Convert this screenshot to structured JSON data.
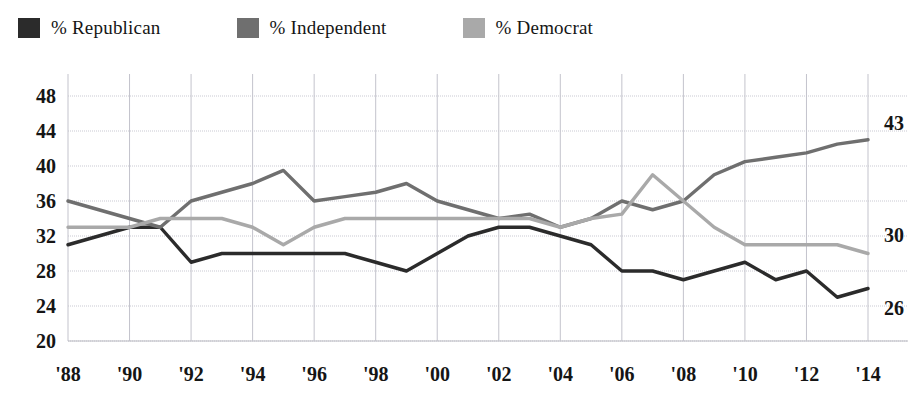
{
  "legend": {
    "items": [
      {
        "label": "% Republican",
        "color": "#2b2b2b",
        "key": "republican"
      },
      {
        "label": "% Independent",
        "color": "#6f6f6f",
        "key": "independent"
      },
      {
        "label": "% Democrat",
        "color": "#a9a9a9",
        "key": "democrat"
      }
    ]
  },
  "axes": {
    "y_ticks": [
      "20",
      "24",
      "28",
      "32",
      "36",
      "40",
      "44",
      "48"
    ],
    "x_ticks": [
      "'88",
      "'90",
      "'92",
      "'94",
      "'96",
      "'98",
      "'00",
      "'02",
      "'04",
      "'06",
      "'08",
      "'10",
      "'12",
      "'14"
    ]
  },
  "end_labels": [
    {
      "name": "independent-end-label",
      "text": "43",
      "value": 43
    },
    {
      "name": "democrat-end-label",
      "text": "30",
      "value": 30
    },
    {
      "name": "republican-end-label",
      "text": "26",
      "value": 26
    }
  ],
  "chart_data": {
    "type": "line",
    "title": "",
    "subtitle": "",
    "xlabel": "",
    "ylabel": "",
    "xlim": [
      1988,
      2014
    ],
    "ylim": [
      20,
      48
    ],
    "y_tick_step": 4,
    "grid": true,
    "legend_position": "top-left",
    "x": [
      1988,
      1989,
      1990,
      1991,
      1992,
      1993,
      1994,
      1995,
      1996,
      1997,
      1998,
      1999,
      2000,
      2001,
      2002,
      2003,
      2004,
      2005,
      2006,
      2007,
      2008,
      2009,
      2010,
      2011,
      2012,
      2013,
      2014
    ],
    "series": [
      {
        "name": "% Republican",
        "color": "#2b2b2b",
        "values": [
          31,
          32,
          33,
          33,
          29,
          30,
          30,
          30,
          30,
          30,
          29,
          28,
          30,
          32,
          33,
          33,
          32,
          31,
          28,
          28,
          27,
          28,
          29,
          27,
          28,
          25,
          26
        ]
      },
      {
        "name": "% Independent",
        "color": "#6f6f6f",
        "values": [
          36,
          35,
          34,
          33,
          36,
          37,
          38,
          39.5,
          36,
          36.5,
          37,
          38,
          36,
          35,
          34,
          34.5,
          33,
          34,
          36,
          35,
          36,
          39,
          40.5,
          41,
          41.5,
          42.5,
          43
        ]
      },
      {
        "name": "% Democrat",
        "color": "#a9a9a9",
        "values": [
          33,
          33,
          33,
          34,
          34,
          34,
          33,
          31,
          33,
          34,
          34,
          34,
          34,
          34,
          34,
          34,
          33,
          34,
          34.5,
          39,
          36,
          33,
          31,
          31,
          31,
          31,
          30
        ]
      }
    ],
    "annotations": [
      {
        "text": "43",
        "series": "% Independent",
        "x": 2014,
        "y": 43
      },
      {
        "text": "30",
        "series": "% Democrat",
        "x": 2014,
        "y": 30
      },
      {
        "text": "26",
        "series": "% Republican",
        "x": 2014,
        "y": 26
      }
    ]
  }
}
